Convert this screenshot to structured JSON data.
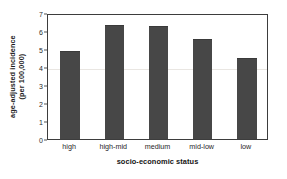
{
  "chart_data": {
    "type": "bar",
    "title": "",
    "subtitle": "",
    "categories": [
      "high",
      "high-mid",
      "medium",
      "mid-low",
      "low"
    ],
    "values": [
      4.85,
      6.3,
      6.2,
      5.5,
      4.45
    ],
    "xlabel": "socio-economic status",
    "ylabel": "age-adjusted incidence (per 100,000)",
    "ylabel_line1": "age-adjusted incidence",
    "ylabel_line2": "(per 100,000)",
    "ylim": [
      0,
      7
    ],
    "ytick_labels": [
      "0",
      "1",
      "2",
      "3",
      "4",
      "5",
      "6",
      "7"
    ],
    "ytick_values": [
      0,
      1,
      2,
      3,
      4,
      5,
      6,
      7
    ],
    "grid": true,
    "legend": false,
    "legend_position": "none",
    "bar_color": "#474747",
    "plot_border_color": "#3d3d3d",
    "gridline_color": "#e9e6e2",
    "background_color": "#ffffff"
  }
}
